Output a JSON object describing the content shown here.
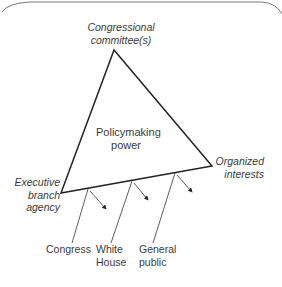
{
  "diagram": {
    "type": "iron-triangle",
    "vertices": {
      "top": {
        "line1": "Congressional",
        "line2": "committee(s)"
      },
      "left": {
        "line1": "Executive",
        "line2": "branch",
        "line3": "agency"
      },
      "right": {
        "line1": "Organized",
        "line2": "interests"
      }
    },
    "center": {
      "line1": "Policymaking",
      "line2": "power"
    },
    "external": [
      {
        "line1": "Congress",
        "line2": ""
      },
      {
        "line1": "White",
        "line2": "House"
      },
      {
        "line1": "General",
        "line2": "public"
      }
    ],
    "colors": {
      "line": "#222222",
      "text": "#3a3a3a",
      "frame": "#666666"
    }
  }
}
